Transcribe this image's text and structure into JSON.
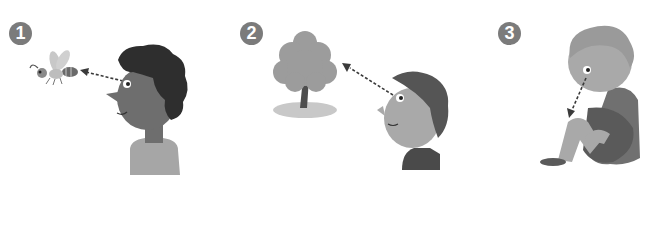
{
  "panels": [
    {
      "number": "1",
      "subject": "boy looking at a bee",
      "target": "bee"
    },
    {
      "number": "2",
      "subject": "girl looking at a tree",
      "target": "tree"
    },
    {
      "number": "3",
      "subject": "child looking down at own knee",
      "target": "knee"
    }
  ],
  "colors": {
    "badge": "#7b7b7b",
    "skin_dark": "#6e6e6e",
    "skin_light": "#a9a9a9",
    "hair_dark": "#2e2e2e",
    "shirt": "#9a9a9a",
    "arrow": "#3a3a3a"
  }
}
